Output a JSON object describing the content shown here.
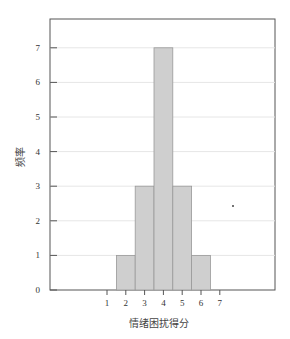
{
  "chart_data": {
    "type": "bar",
    "title": "",
    "xlabel": "情绪困扰得分",
    "ylabel": "频率",
    "x_ticks": [
      "1",
      "2",
      "3",
      "4",
      "5",
      "6",
      "7"
    ],
    "y_ticks": [
      "0",
      "1",
      "2",
      "3",
      "4",
      "5",
      "6",
      "7"
    ],
    "categories": [
      "2",
      "3",
      "4",
      "5",
      "6"
    ],
    "values": [
      1,
      3,
      7,
      3,
      1
    ],
    "ylim": [
      0,
      7.7
    ],
    "grid": true,
    "bar_color": "#cfcfcf",
    "bar_edge_color": "#999999"
  }
}
